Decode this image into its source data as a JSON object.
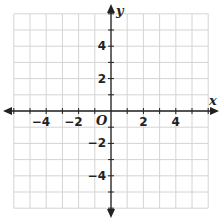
{
  "diagram": {
    "type": "coordinate-plane",
    "x_axis_label": "x",
    "y_axis_label": "y",
    "origin_label": "O",
    "x_range": [
      -6,
      6
    ],
    "y_range": [
      -6,
      6
    ],
    "grid_step": 1,
    "x_tick_labels": [
      {
        "value": -4,
        "text": "−4"
      },
      {
        "value": -2,
        "text": "−2"
      },
      {
        "value": 2,
        "text": "2"
      },
      {
        "value": 4,
        "text": "4"
      }
    ],
    "y_tick_labels": [
      {
        "value": 4,
        "text": "4"
      },
      {
        "value": 2,
        "text": "2"
      },
      {
        "value": -2,
        "text": "−2"
      },
      {
        "value": -4,
        "text": "−4"
      }
    ],
    "colors": {
      "grid": "#d4d4d4",
      "axis": "#222222",
      "background": "#ffffff"
    }
  }
}
